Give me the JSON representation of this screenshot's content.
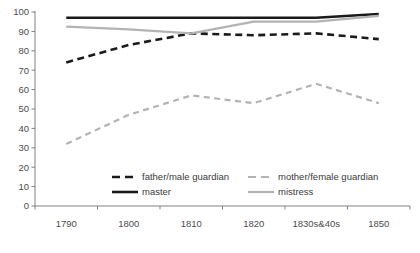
{
  "chart_data": {
    "type": "line",
    "title": "",
    "subtitle": "",
    "xlabel": "",
    "ylabel": "",
    "categories": [
      "1790",
      "1800",
      "1810",
      "1820",
      "1830s&40s",
      "1850"
    ],
    "ylim": [
      0,
      100
    ],
    "ytick_values": [
      0,
      10,
      20,
      30,
      40,
      50,
      60,
      70,
      80,
      90,
      100
    ],
    "ytick_labels": [
      "0",
      "10",
      "20",
      "30",
      "40",
      "50",
      "60",
      "70",
      "80",
      "90",
      "100"
    ],
    "grid": false,
    "legend_position": "inside-bottom",
    "series": [
      {
        "name": "father/male guardian",
        "values": [
          74,
          83,
          89,
          88,
          89,
          86
        ],
        "color": "#1a1a1a",
        "style": "dashed",
        "width": 2.6
      },
      {
        "name": "master",
        "values": [
          97,
          97,
          97,
          97,
          97,
          99
        ],
        "color": "#1a1a1a",
        "style": "solid",
        "width": 2.4
      },
      {
        "name": "mother/female guardian",
        "values": [
          32,
          47,
          57,
          53,
          63,
          53
        ],
        "color": "#b3b3b3",
        "style": "dashed",
        "width": 2.2
      },
      {
        "name": "mistress",
        "values": [
          92.5,
          91,
          89,
          95,
          95,
          98
        ],
        "color": "#b3b3b3",
        "style": "solid",
        "width": 2.2
      }
    ]
  },
  "legend": {
    "entries": [
      {
        "label": "father/male guardian",
        "color": "#1a1a1a",
        "style": "dashed"
      },
      {
        "label": "mother/female guardian",
        "color": "#b3b3b3",
        "style": "dashed"
      },
      {
        "label": "master",
        "color": "#1a1a1a",
        "style": "solid"
      },
      {
        "label": "mistress",
        "color": "#b3b3b3",
        "style": "solid"
      }
    ]
  },
  "axes": {
    "axis_color": "#808080",
    "tick_color": "#808080",
    "label_color": "#4d4d4d"
  }
}
